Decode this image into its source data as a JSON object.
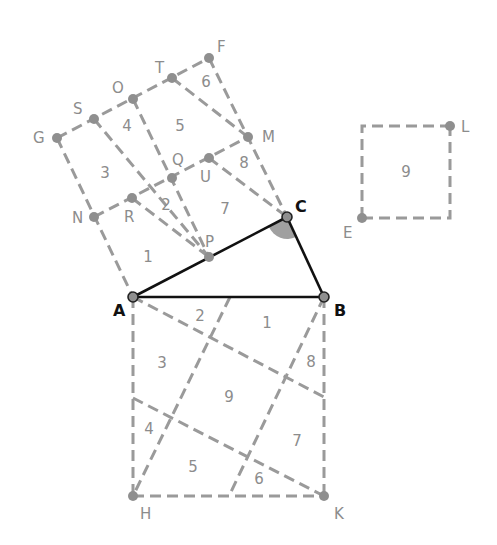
{
  "diagram": {
    "triangle": {
      "vertices": [
        "A",
        "B",
        "C"
      ],
      "right_angle_at": "C"
    },
    "main_labels": {
      "A": "A",
      "B": "B",
      "C": "C"
    },
    "point_labels": {
      "F": "F",
      "T": "T",
      "O": "O",
      "S": "S",
      "G": "G",
      "M": "M",
      "Q": "Q",
      "U": "U",
      "N": "N",
      "R": "R",
      "P": "P",
      "L": "L",
      "E": "E",
      "H": "H",
      "K": "K"
    },
    "upper_square_pieces": [
      "1",
      "2",
      "3",
      "4",
      "5",
      "6",
      "7",
      "8"
    ],
    "small_square_piece": "9",
    "lower_square_pieces": [
      "1",
      "2",
      "3",
      "4",
      "5",
      "6",
      "7",
      "8",
      "9"
    ],
    "colors": {
      "dashed": "#9a9a9a",
      "triangle": "#111111",
      "angle_marker": "#a0a0a0"
    }
  }
}
